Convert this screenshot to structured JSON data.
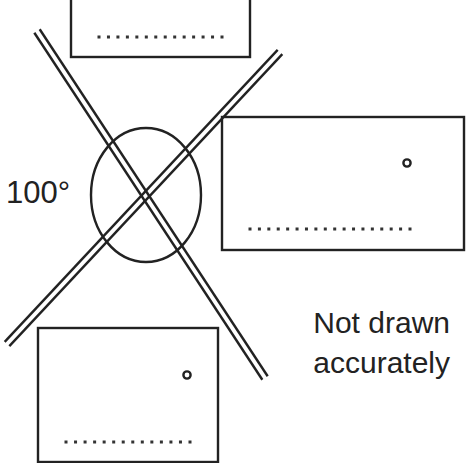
{
  "diagram": {
    "angle_label": "100°",
    "note_lines": [
      "Not drawn",
      "accurately"
    ],
    "colors": {
      "ink": "#222222",
      "background": "#ffffff"
    },
    "intersecting_lines": [
      {
        "name": "line-a",
        "from": [
          37,
          31
        ],
        "to": [
          265,
          378
        ]
      },
      {
        "name": "line-b",
        "from": [
          280,
          52
        ],
        "to": [
          7,
          344
        ]
      }
    ],
    "angle_circle": {
      "cx": 146,
      "cy": 195,
      "rx": 55,
      "ry": 67
    },
    "answer_boxes": [
      {
        "name": "top-answer-box",
        "x": 71,
        "y": -4,
        "w": 179,
        "h": 61,
        "dots": 14,
        "dots_x0": 99,
        "dots_x1": 222,
        "dots_y": 37,
        "has_degree": false
      },
      {
        "name": "right-answer-box",
        "x": 222,
        "y": 117,
        "w": 242,
        "h": 133,
        "dots": 18,
        "dots_x0": 250,
        "dots_x1": 410,
        "dots_y": 229,
        "has_degree": true,
        "degree_x": 407,
        "degree_y": 163
      },
      {
        "name": "bottom-answer-box",
        "x": 38,
        "y": 328,
        "w": 180,
        "h": 134,
        "dots": 14,
        "dots_x0": 66,
        "dots_x1": 190,
        "dots_y": 442,
        "has_degree": true,
        "degree_x": 187,
        "degree_y": 375
      }
    ]
  }
}
